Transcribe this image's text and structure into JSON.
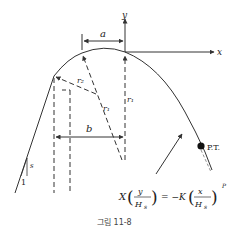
{
  "figure": {
    "caption": "그림 11-8",
    "axes": {
      "x_label": "x",
      "y_label": "y"
    },
    "dimensions": {
      "a": "a",
      "b": "b"
    },
    "radii": {
      "r1_left": "r₁",
      "r1_right": "r₁",
      "r2": "r₂"
    },
    "slope": {
      "rise": "s",
      "run": "1"
    },
    "point_label": "P.T.",
    "equation": {
      "lhs_coef": "X",
      "lhs_num": "y",
      "lhs_den": "H",
      "lhs_den_sub": "s",
      "equals": "= −K",
      "rhs_num": "x",
      "rhs_den": "H",
      "rhs_den_sub": "s",
      "exponent": "P"
    },
    "colors": {
      "line": "#333333",
      "background": "#ffffff"
    }
  }
}
